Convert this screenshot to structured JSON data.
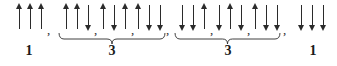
{
  "figure": {
    "arrow_color": "#2b2b2b",
    "background_color": "#ffffff",
    "separator": ",",
    "groups": [
      {
        "id": "group-1",
        "label": "1",
        "braced": false,
        "terms": [
          {
            "id": "term-uuu",
            "arrows": [
              "up",
              "up",
              "up"
            ],
            "comma": ","
          }
        ]
      },
      {
        "id": "group-2",
        "label": "3",
        "braced": true,
        "terms": [
          {
            "id": "term-uud",
            "arrows": [
              "up",
              "up",
              "down"
            ],
            "comma": ","
          },
          {
            "id": "term-udu",
            "arrows": [
              "up",
              "down",
              "up"
            ],
            "comma": ","
          },
          {
            "id": "term-udd-a",
            "arrows": [
              "up",
              "down",
              "down"
            ],
            "comma": ","
          }
        ]
      },
      {
        "id": "group-3",
        "label": "3",
        "braced": true,
        "terms": [
          {
            "id": "term-ddu",
            "arrows": [
              "down",
              "down",
              "up"
            ],
            "comma": ","
          },
          {
            "id": "term-dud",
            "arrows": [
              "down",
              "up",
              "down"
            ],
            "comma": ","
          },
          {
            "id": "term-udd-b",
            "arrows": [
              "up",
              "down",
              "down"
            ],
            "comma": ","
          }
        ]
      },
      {
        "id": "group-4",
        "label": "1",
        "braced": false,
        "terms": [
          {
            "id": "term-ddd",
            "arrows": [
              "down",
              "down",
              "down"
            ],
            "comma": ""
          }
        ]
      }
    ]
  }
}
